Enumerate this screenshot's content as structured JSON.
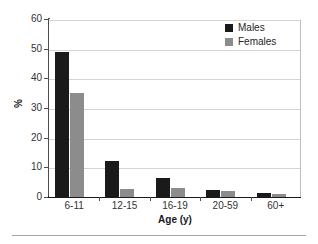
{
  "chart_data": {
    "type": "bar",
    "title": "",
    "subtitle": "",
    "xlabel": "Age (y)",
    "ylabel": "%",
    "categories": [
      "6-11",
      "12-15",
      "16-19",
      "20-59",
      "60+"
    ],
    "series": [
      {
        "name": "Males",
        "color": "#1a1a1a",
        "values": [
          49,
          12,
          6.5,
          2.5,
          1.5
        ]
      },
      {
        "name": "Females",
        "color": "#8c8c8c",
        "values": [
          35,
          2.7,
          3,
          2,
          1
        ]
      }
    ],
    "ylim": [
      0,
      60
    ],
    "yticks": [
      0,
      10,
      20,
      30,
      40,
      50,
      60
    ],
    "ytick_labels": [
      "0",
      "10",
      "20",
      "30",
      "40",
      "50",
      "60"
    ],
    "grid": "horizontal",
    "legend_position": "top-right",
    "legend_entries": [
      "Males",
      "Females"
    ]
  }
}
